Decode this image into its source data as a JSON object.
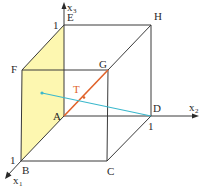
{
  "diagram": {
    "vertices": {
      "A": "A",
      "B": "B",
      "C": "C",
      "D": "D",
      "E": "E",
      "F": "F",
      "G": "G",
      "H": "H"
    },
    "axes": {
      "x1": {
        "label": "x",
        "sub": "1",
        "unit": "1"
      },
      "x2": {
        "label": "x",
        "sub": "2",
        "unit": "1"
      },
      "x3": {
        "label": "x",
        "sub": "3",
        "unit": "1"
      }
    },
    "point_T": "T",
    "colors": {
      "face_ABFE": "#fdf7b0",
      "segment_AG": "#e0622a",
      "line_to_D": "#3bb8cc",
      "edges": "#3a3a3a"
    }
  }
}
